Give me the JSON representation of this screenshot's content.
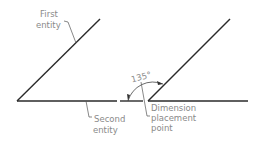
{
  "diagram": {
    "type": "angular-dimension-illustration",
    "left_figure": {
      "labels": {
        "first_entity_line1": "First",
        "first_entity_line2": "entity",
        "second_entity_line1": "Second",
        "second_entity_line2": "entity"
      }
    },
    "right_figure": {
      "dimension_value": "135°",
      "labels": {
        "placement_line1": "Dimension",
        "placement_line2": "placement",
        "placement_line3": "point"
      }
    },
    "colors": {
      "lines": "#2a2a2a",
      "text": "#8a8a8a",
      "background": "#ffffff"
    }
  }
}
